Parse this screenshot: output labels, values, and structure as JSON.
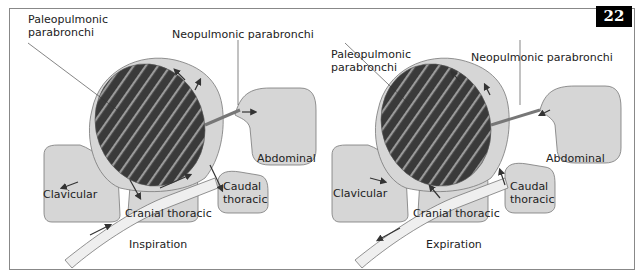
{
  "figure_number": "22",
  "panels": [
    {
      "caption": "Inspiration",
      "labels": {
        "paleo_line1": "Paleopulmonic",
        "paleo_line2": "parabronchi",
        "neo": "Neopulmonic parabronchi",
        "abdominal": "Abdominal",
        "clavicular": "Clavicular",
        "cranial": "Cranial thoracic",
        "caudal1": "Caudal",
        "caudal2": "thoracic"
      }
    },
    {
      "caption": "Expiration",
      "labels": {
        "paleo_line1": "Paleopulmonic",
        "paleo_line2": "parabronchi",
        "neo": "Neopulmonic parabronchi",
        "abdominal": "Abdominal",
        "clavicular": "Clavicular",
        "cranial": "Cranial thoracic",
        "caudal1": "Caudal",
        "caudal2": "thoracic"
      }
    }
  ],
  "colors": {
    "sac_fill": "#d6d6d6",
    "paleo_fill": "#3a3a3a",
    "stripe": "#9a9a9a",
    "outline": "#777777",
    "arrow": "#333333"
  }
}
